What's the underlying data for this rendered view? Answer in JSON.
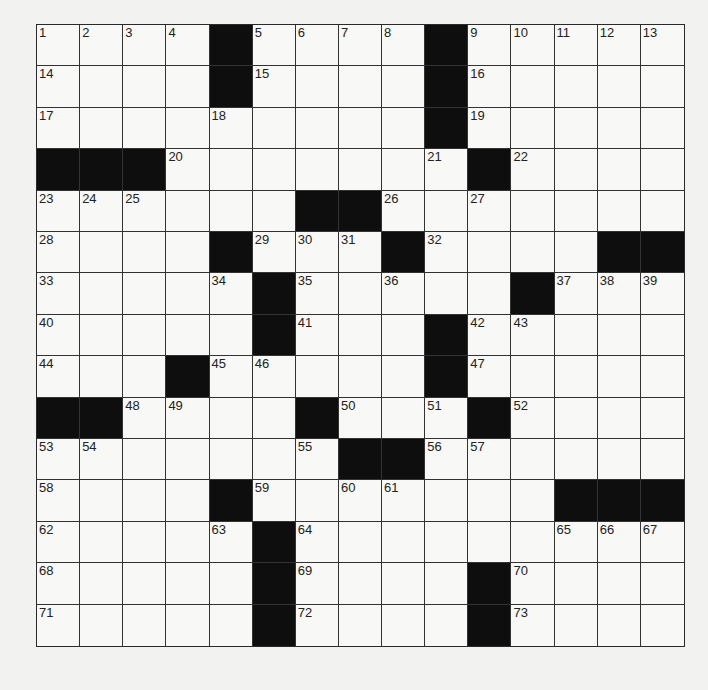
{
  "puzzle": {
    "type": "crossword",
    "rows": 15,
    "cols": 15,
    "colors": {
      "black_square": "#0e0e0e",
      "white_square": "#f8f8f6",
      "grid_line": "#333333",
      "background": "#f2f2f0"
    },
    "black_cells": [
      [
        0,
        4
      ],
      [
        0,
        9
      ],
      [
        1,
        4
      ],
      [
        1,
        9
      ],
      [
        2,
        9
      ],
      [
        3,
        0
      ],
      [
        3,
        1
      ],
      [
        3,
        2
      ],
      [
        3,
        10
      ],
      [
        4,
        6
      ],
      [
        4,
        7
      ],
      [
        5,
        4
      ],
      [
        5,
        8
      ],
      [
        5,
        13
      ],
      [
        5,
        14
      ],
      [
        6,
        5
      ],
      [
        6,
        11
      ],
      [
        7,
        5
      ],
      [
        7,
        9
      ],
      [
        8,
        3
      ],
      [
        8,
        9
      ],
      [
        9,
        0
      ],
      [
        9,
        1
      ],
      [
        9,
        6
      ],
      [
        9,
        10
      ],
      [
        10,
        7
      ],
      [
        10,
        8
      ],
      [
        11,
        4
      ],
      [
        11,
        12
      ],
      [
        11,
        13
      ],
      [
        11,
        14
      ],
      [
        12,
        5
      ],
      [
        13,
        5
      ],
      [
        13,
        10
      ],
      [
        14,
        5
      ],
      [
        14,
        10
      ]
    ],
    "numbers": [
      {
        "r": 0,
        "c": 0,
        "n": "1"
      },
      {
        "r": 0,
        "c": 1,
        "n": "2"
      },
      {
        "r": 0,
        "c": 2,
        "n": "3"
      },
      {
        "r": 0,
        "c": 3,
        "n": "4"
      },
      {
        "r": 0,
        "c": 5,
        "n": "5"
      },
      {
        "r": 0,
        "c": 6,
        "n": "6"
      },
      {
        "r": 0,
        "c": 7,
        "n": "7"
      },
      {
        "r": 0,
        "c": 8,
        "n": "8"
      },
      {
        "r": 0,
        "c": 10,
        "n": "9"
      },
      {
        "r": 0,
        "c": 11,
        "n": "10"
      },
      {
        "r": 0,
        "c": 12,
        "n": "11"
      },
      {
        "r": 0,
        "c": 13,
        "n": "12"
      },
      {
        "r": 0,
        "c": 14,
        "n": "13"
      },
      {
        "r": 1,
        "c": 0,
        "n": "14"
      },
      {
        "r": 1,
        "c": 5,
        "n": "15"
      },
      {
        "r": 1,
        "c": 10,
        "n": "16"
      },
      {
        "r": 2,
        "c": 0,
        "n": "17"
      },
      {
        "r": 2,
        "c": 4,
        "n": "18"
      },
      {
        "r": 2,
        "c": 10,
        "n": "19"
      },
      {
        "r": 3,
        "c": 3,
        "n": "20"
      },
      {
        "r": 3,
        "c": 9,
        "n": "21"
      },
      {
        "r": 3,
        "c": 11,
        "n": "22"
      },
      {
        "r": 4,
        "c": 0,
        "n": "23"
      },
      {
        "r": 4,
        "c": 1,
        "n": "24"
      },
      {
        "r": 4,
        "c": 2,
        "n": "25"
      },
      {
        "r": 4,
        "c": 8,
        "n": "26"
      },
      {
        "r": 4,
        "c": 10,
        "n": "27"
      },
      {
        "r": 5,
        "c": 0,
        "n": "28"
      },
      {
        "r": 5,
        "c": 5,
        "n": "29"
      },
      {
        "r": 5,
        "c": 6,
        "n": "30"
      },
      {
        "r": 5,
        "c": 7,
        "n": "31"
      },
      {
        "r": 5,
        "c": 9,
        "n": "32"
      },
      {
        "r": 6,
        "c": 0,
        "n": "33"
      },
      {
        "r": 6,
        "c": 4,
        "n": "34"
      },
      {
        "r": 6,
        "c": 6,
        "n": "35"
      },
      {
        "r": 6,
        "c": 8,
        "n": "36"
      },
      {
        "r": 6,
        "c": 12,
        "n": "37"
      },
      {
        "r": 6,
        "c": 13,
        "n": "38"
      },
      {
        "r": 6,
        "c": 14,
        "n": "39"
      },
      {
        "r": 7,
        "c": 0,
        "n": "40"
      },
      {
        "r": 7,
        "c": 6,
        "n": "41"
      },
      {
        "r": 7,
        "c": 10,
        "n": "42"
      },
      {
        "r": 7,
        "c": 11,
        "n": "43"
      },
      {
        "r": 8,
        "c": 0,
        "n": "44"
      },
      {
        "r": 8,
        "c": 4,
        "n": "45"
      },
      {
        "r": 8,
        "c": 5,
        "n": "46"
      },
      {
        "r": 8,
        "c": 10,
        "n": "47"
      },
      {
        "r": 9,
        "c": 2,
        "n": "48"
      },
      {
        "r": 9,
        "c": 3,
        "n": "49"
      },
      {
        "r": 9,
        "c": 7,
        "n": "50"
      },
      {
        "r": 9,
        "c": 9,
        "n": "51"
      },
      {
        "r": 9,
        "c": 11,
        "n": "52"
      },
      {
        "r": 10,
        "c": 0,
        "n": "53"
      },
      {
        "r": 10,
        "c": 1,
        "n": "54"
      },
      {
        "r": 10,
        "c": 6,
        "n": "55"
      },
      {
        "r": 10,
        "c": 9,
        "n": "56"
      },
      {
        "r": 10,
        "c": 10,
        "n": "57"
      },
      {
        "r": 11,
        "c": 0,
        "n": "58"
      },
      {
        "r": 11,
        "c": 5,
        "n": "59"
      },
      {
        "r": 11,
        "c": 7,
        "n": "60"
      },
      {
        "r": 11,
        "c": 8,
        "n": "61"
      },
      {
        "r": 12,
        "c": 0,
        "n": "62"
      },
      {
        "r": 12,
        "c": 4,
        "n": "63"
      },
      {
        "r": 12,
        "c": 6,
        "n": "64"
      },
      {
        "r": 12,
        "c": 12,
        "n": "65"
      },
      {
        "r": 12,
        "c": 13,
        "n": "66"
      },
      {
        "r": 12,
        "c": 14,
        "n": "67"
      },
      {
        "r": 13,
        "c": 0,
        "n": "68"
      },
      {
        "r": 13,
        "c": 6,
        "n": "69"
      },
      {
        "r": 13,
        "c": 11,
        "n": "70"
      },
      {
        "r": 14,
        "c": 0,
        "n": "71"
      },
      {
        "r": 14,
        "c": 6,
        "n": "72"
      },
      {
        "r": 14,
        "c": 11,
        "n": "73"
      }
    ]
  }
}
